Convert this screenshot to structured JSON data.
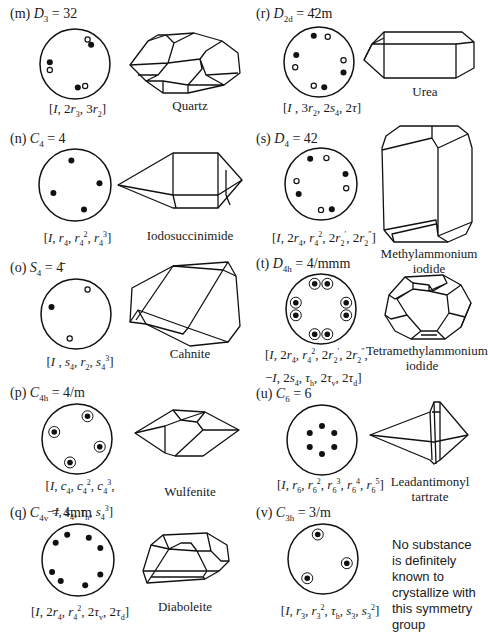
{
  "figure": {
    "panels": [
      {
        "id": "m",
        "label": "(m)",
        "group_symbol": "D",
        "group_sub": "3",
        "hm_symbol": "32",
        "formula_html": "[<i>I</i>, 2<i>r</i><sub>3</sub>, 3<i>r</i><sub>2</sub>]",
        "substance": "Quartz",
        "stereogram": {
          "filled": [
            [
              -0.72,
              -0.05
            ],
            [
              0.46,
              -0.55
            ],
            [
              0.08,
              0.67
            ]
          ],
          "open": [
            [
              -0.72,
              0.17
            ],
            [
              0.36,
              -0.7
            ],
            [
              0.29,
              0.63
            ]
          ],
          "ringed": []
        }
      },
      {
        "id": "n",
        "label": "(n)",
        "group_symbol": "C",
        "group_sub": "4",
        "hm_symbol": "4",
        "formula_html": "[<i>I</i>, <i>r</i><sub>4</sub>, <i>r</i><sub>4</sub><sup>2</sup>, <i>r</i><sub>4</sub><sup>3</sup>]",
        "substance": "Iodosuccinimide",
        "stereogram": {
          "filled": [
            [
              -0.1,
              -0.68
            ],
            [
              0.68,
              -0.05
            ],
            [
              -0.6,
              0.22
            ],
            [
              0.25,
              0.68
            ]
          ],
          "open": [],
          "ringed": []
        }
      },
      {
        "id": "o",
        "label": "(o)",
        "group_symbol": "S",
        "group_sub": "4",
        "hm_symbol": "4̄",
        "formula_html": "[<i>I</i> , <i>s</i><sub>4</sub>, <i>r</i><sub>2</sub>, <i>s</i><sub>4</sub><sup>3</sup>]",
        "substance": "Cahnite",
        "stereogram": {
          "filled": [
            [
              -0.7,
              -0.2
            ]
          ],
          "open": [
            [
              0.33,
              -0.7
            ],
            [
              -0.18,
              0.7
            ]
          ],
          "ringed": []
        }
      },
      {
        "id": "p",
        "label": "(p)",
        "group_symbol": "C",
        "group_sub": "4h",
        "hm_symbol": "4/m",
        "formula_html": "[<i>I</i>, <i>c</i><sub>4</sub>, <i>c</i><sub>4</sub><sup>2</sup>, <i>c</i><sub>4</sub><sup>3</sup>,<br>−<i>I</i>, <i>s</i><sub>4</sub>, <i>τ</i><sub>h</sub>, <i>s</i><sub>4</sub><sup>3</sup>]",
        "substance": "Wulfenite",
        "stereogram": {
          "filled": [],
          "open": [],
          "ringed": [
            [
              0.3,
              -0.65
            ],
            [
              -0.65,
              -0.2
            ],
            [
              0.65,
              0.22
            ],
            [
              -0.2,
              0.67
            ]
          ]
        }
      },
      {
        "id": "q",
        "label": "(q)",
        "group_symbol": "C",
        "group_sub": "4v",
        "hm_symbol": "4mm",
        "formula_html": "[<i>I</i>, 2<i>r</i><sub>4</sub>, <i>r</i><sub>4</sub><sup>2</sup>, 2<i>τ</i><sub>v</sub>, 2<i>τ</i><sub>d</sub>]",
        "substance": "Diaboleite",
        "stereogram": {
          "filled": [
            [
              -0.3,
              -0.7
            ],
            [
              0.3,
              -0.62
            ],
            [
              -0.62,
              -0.48
            ],
            [
              0.62,
              -0.33
            ],
            [
              -0.72,
              0.33
            ],
            [
              0.62,
              0.4
            ],
            [
              -0.48,
              0.58
            ],
            [
              0.2,
              0.7
            ]
          ],
          "open": [],
          "ringed": []
        }
      },
      {
        "id": "r",
        "label": "(r)",
        "group_symbol": "D",
        "group_sub": "2d",
        "hm_symbol": "4̄2m",
        "formula_html": "[<i>I</i> , 3<i>r</i><sub>2</sub>, 2<i>s</i><sub>4</sub>, 2<i>τ</i>]",
        "substance": "Urea",
        "stereogram": {
          "filled": [
            [
              -0.15,
              -0.75
            ],
            [
              -0.65,
              -0.2
            ],
            [
              0.7,
              0.3
            ],
            [
              0.15,
              0.72
            ]
          ],
          "open": [
            [
              0.25,
              -0.72
            ],
            [
              0.7,
              -0.05
            ],
            [
              -0.68,
              0.15
            ],
            [
              -0.15,
              0.68
            ]
          ],
          "ringed": []
        }
      },
      {
        "id": "s",
        "label": "(s)",
        "group_symbol": "D",
        "group_sub": "4",
        "hm_symbol": "42",
        "formula_html": "[<i>I</i>, 2<i>r</i><sub>4</sub>, <i>r</i><sub>4</sub><sup>2</sup>, 2<i>r</i><sub>2</sub><sup>′</sup>, 2<i>r</i><sub>2</sub><sup>″</sup>]",
        "substance": "Methylammonium iodide",
        "stereogram": {
          "filled": [
            [
              -0.3,
              -0.7
            ],
            [
              0.68,
              -0.28
            ],
            [
              -0.62,
              0.28
            ],
            [
              0.3,
              0.7
            ]
          ],
          "open": [
            [
              0.15,
              -0.72
            ],
            [
              0.7,
              0.12
            ],
            [
              -0.68,
              -0.08
            ],
            [
              0.0,
              0.72
            ]
          ],
          "ringed": []
        }
      },
      {
        "id": "t",
        "label": "(t)",
        "group_symbol": "D",
        "group_sub": "4h",
        "hm_symbol": "4/mmm",
        "formula_html": "[<i>I</i>, 2<i>r</i><sub>4</sub>, <i>r</i><sub>4</sub><sup>2</sup>, 2<i>r</i><sub>2</sub><sup>′</sup>, 2<i>r</i><sub>2</sub><sup>″</sup>,<br>−<i>I</i>, 2<i>s</i><sub>4</sub>, <i>τ</i><sub>h</sub>, 2<i>τ</i><sub>v</sub>, 2<i>τ</i><sub>d</sub>]",
        "substance": "Tetramethylammonium iodide",
        "stereogram": {
          "filled": [],
          "open": [],
          "ringed": [
            [
              -0.18,
              -0.72
            ],
            [
              0.18,
              -0.72
            ],
            [
              0.72,
              -0.18
            ],
            [
              0.72,
              0.18
            ],
            [
              0.18,
              0.72
            ],
            [
              -0.18,
              0.72
            ],
            [
              -0.72,
              0.18
            ],
            [
              -0.72,
              -0.18
            ]
          ]
        }
      },
      {
        "id": "u",
        "label": "(u)",
        "group_symbol": "C",
        "group_sub": "6",
        "hm_symbol": "6",
        "formula_html": "[<i>I</i>, <i>r</i><sub>6</sub>, <i>r</i><sub>6</sub><sup>2</sup>, <i>r</i><sub>6</sub><sup>3</sup>, <i>r</i><sub>6</sub><sup>4</sup>, <i>r</i><sub>6</sub><sup>5</sup>]",
        "substance": "Leadantimonyl tartrate",
        "stereogram": {
          "filled": [
            [
              0,
              -0.4
            ],
            [
              0.35,
              -0.2
            ],
            [
              0.35,
              0.2
            ],
            [
              0,
              0.4
            ],
            [
              -0.35,
              0.2
            ],
            [
              -0.35,
              -0.2
            ]
          ],
          "open": [],
          "ringed": []
        }
      },
      {
        "id": "v",
        "label": "(v)",
        "group_symbol": "C",
        "group_sub": "3h",
        "hm_symbol": "3/m",
        "formula_html": "[<i>I</i>, <i>r</i><sub>3</sub>, <i>r</i><sub>3</sub><sup>2</sup>, <i>τ</i><sub>h</sub>, <i>s</i><sub>3</sub>, <i>s</i><sub>3</sub><sup>2</sup>]",
        "substance": "",
        "note": "No substance is definitely known to crystallize with this symmetry group",
        "stereogram": {
          "filled": [],
          "open": [],
          "ringed": [
            [
              -0.15,
              -0.7
            ],
            [
              0.68,
              0.12
            ],
            [
              -0.45,
              0.55
            ]
          ]
        }
      }
    ]
  }
}
